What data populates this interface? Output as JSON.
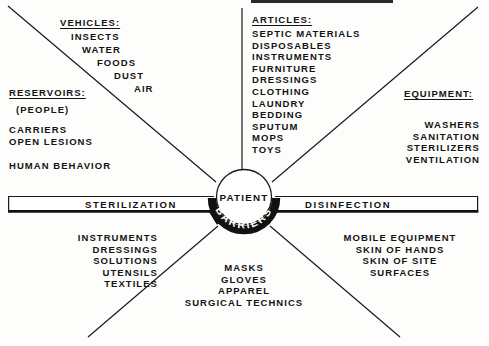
{
  "diagram": {
    "title_bar": {
      "cropped": true,
      "label": ""
    },
    "center": {
      "patient_label": "PATIENT",
      "barriers_label": "BARRIERS"
    },
    "bar": {
      "left_label": "STERILIZATION",
      "right_label": "DISINFECTION"
    },
    "sectors": [
      {
        "id": "vehicles",
        "heading": "VEHICLES:",
        "align": "right-staircase",
        "items": [
          "INSECTS",
          "WATER",
          "FOODS",
          "DUST",
          "AIR"
        ]
      },
      {
        "id": "reservoirs",
        "heading": "RESERVOIRS:",
        "align": "left",
        "items": [
          "(PEOPLE)",
          "CARRIERS",
          "OPEN LESIONS",
          "HUMAN BEHAVIOR"
        ]
      },
      {
        "id": "articles",
        "heading": "ARTICLES:",
        "align": "left",
        "items": [
          "SEPTIC MATERIALS",
          "DISPOSABLES",
          "INSTRUMENTS",
          "FURNITURE",
          "DRESSINGS",
          "CLOTHING",
          "LAUNDRY",
          "BEDDING",
          "SPUTUM",
          "MOPS",
          "TOYS"
        ]
      },
      {
        "id": "equipment",
        "heading": "EQUIPMENT:",
        "align": "right",
        "items": [
          "WASHERS",
          "SANITATION",
          "STERILIZERS",
          "VENTILATION"
        ]
      },
      {
        "id": "sterilization-items",
        "heading": "",
        "align": "right",
        "items": [
          "INSTRUMENTS",
          "DRESSINGS",
          "SOLUTIONS",
          "UTENSILS",
          "TEXTILES"
        ]
      },
      {
        "id": "barrier-items",
        "heading": "",
        "align": "center",
        "items": [
          "MASKS",
          "GLOVES",
          "APPAREL",
          "SURGICAL TECHNICS"
        ]
      },
      {
        "id": "disinfection-items",
        "heading": "",
        "align": "center",
        "items": [
          "MOBILE EQUIPMENT",
          "SKIN OF HANDS",
          "SKIN OF SITE",
          "SURFACES"
        ]
      }
    ],
    "colors": {
      "ink": "#111111",
      "background": "#fdfdfc",
      "rule": "#1a1a1a"
    }
  }
}
